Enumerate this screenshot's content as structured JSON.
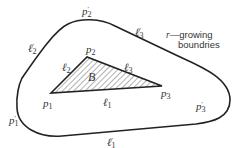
{
  "diagram": {
    "title": "",
    "colors": {
      "stroke": "#222222",
      "hatch": "#555555",
      "text": "#333333",
      "background": "#ffffff"
    },
    "triangle": {
      "region_label": "B",
      "vertices": [
        {
          "name": "p",
          "sub": "1",
          "x": 51,
          "y": 93
        },
        {
          "name": "p",
          "sub": "2",
          "x": 87,
          "y": 57
        },
        {
          "name": "p",
          "sub": "3",
          "x": 162,
          "y": 86
        }
      ],
      "edges": [
        {
          "name": "ℓ",
          "sub": "1"
        },
        {
          "name": "ℓ",
          "sub": "2"
        },
        {
          "name": "ℓ",
          "sub": "3"
        }
      ]
    },
    "outer_boundary": {
      "vertices": [
        {
          "name": "p",
          "sub": "1",
          "prime": "′"
        },
        {
          "name": "p",
          "sub": "2",
          "prime": "′"
        },
        {
          "name": "p",
          "sub": "3",
          "prime": "′"
        }
      ],
      "edges": [
        {
          "name": "ℓ",
          "sub": "1",
          "prime": "′"
        },
        {
          "name": "ℓ",
          "sub": "2",
          "prime": "′"
        },
        {
          "name": "ℓ",
          "sub": "3",
          "prime": "′"
        }
      ]
    },
    "annotation": {
      "symbol": "r",
      "dash": "—",
      "line1": "growing",
      "line2": "boundries"
    }
  }
}
